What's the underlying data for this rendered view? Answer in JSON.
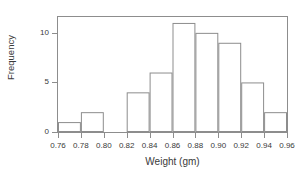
{
  "chart_data": {
    "type": "bar",
    "title": "",
    "xlabel": "Weight (gm)",
    "ylabel": "Frequency",
    "bin_edges": [
      0.76,
      0.78,
      0.8,
      0.82,
      0.84,
      0.86,
      0.88,
      0.9,
      0.92,
      0.94,
      0.96
    ],
    "categories": [
      "0.76-0.78",
      "0.78-0.80",
      "0.80-0.82",
      "0.82-0.84",
      "0.84-0.86",
      "0.86-0.88",
      "0.88-0.90",
      "0.90-0.92",
      "0.92-0.94",
      "0.94-0.96"
    ],
    "values": [
      1,
      2,
      0,
      4,
      6,
      11,
      10,
      9,
      5,
      2
    ],
    "xlim": [
      0.76,
      0.96
    ],
    "ylim": [
      0,
      11.6
    ],
    "xticks": [
      0.76,
      0.78,
      0.8,
      0.82,
      0.84,
      0.86,
      0.88,
      0.9,
      0.92,
      0.94,
      0.96
    ],
    "xtick_labels": [
      "0.76",
      "0.78",
      "0.80",
      "0.82",
      "0.84",
      "0.86",
      "0.88",
      "0.90",
      "0.92",
      "0.94",
      "0.96"
    ],
    "yticks": [
      0,
      5,
      10
    ],
    "ytick_labels": [
      "0",
      "5",
      "10"
    ],
    "grid": false,
    "legend": null,
    "bar_fill_color": "#ffffff",
    "bar_edge_color": "#8d8d8d",
    "axis_color": "#8d8d8d",
    "text_color": "#3a3a3a",
    "background_color": "#ffffff"
  }
}
